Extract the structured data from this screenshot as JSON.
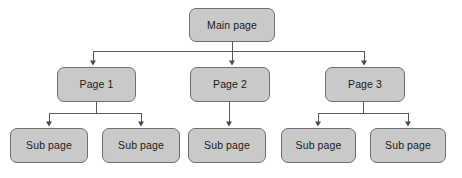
{
  "diagram": {
    "type": "tree",
    "orientation": "top-down",
    "colors": {
      "node_fill": "#c9c9c9",
      "node_border": "#6f6f6f",
      "connector": "#5a5a5a",
      "text": "#1a1a1a",
      "background": "#ffffff"
    },
    "nodes": [
      {
        "id": "main",
        "label": "Main page",
        "level": 0,
        "x": 189,
        "y": 8,
        "w": 86,
        "h": 34
      },
      {
        "id": "page1",
        "label": "Page 1",
        "level": 1,
        "x": 57,
        "y": 67,
        "w": 79,
        "h": 35
      },
      {
        "id": "page2",
        "label": "Page 2",
        "level": 1,
        "x": 190,
        "y": 67,
        "w": 80,
        "h": 35
      },
      {
        "id": "page3",
        "label": "Page 3",
        "level": 1,
        "x": 325,
        "y": 67,
        "w": 80,
        "h": 35
      },
      {
        "id": "sub1",
        "label": "Sub page",
        "level": 2,
        "x": 10,
        "y": 128,
        "w": 78,
        "h": 35
      },
      {
        "id": "sub2",
        "label": "Sub page",
        "level": 2,
        "x": 102,
        "y": 128,
        "w": 78,
        "h": 35
      },
      {
        "id": "sub3",
        "label": "Sub page",
        "level": 2,
        "x": 188,
        "y": 128,
        "w": 78,
        "h": 35
      },
      {
        "id": "sub4",
        "label": "Sub page",
        "level": 2,
        "x": 281,
        "y": 128,
        "w": 75,
        "h": 35
      },
      {
        "id": "sub5",
        "label": "Sub page",
        "level": 2,
        "x": 370,
        "y": 128,
        "w": 76,
        "h": 35
      }
    ],
    "edges": [
      {
        "from": "main",
        "to": "page1",
        "style": "elbow-arrow"
      },
      {
        "from": "main",
        "to": "page2",
        "style": "straight-arrow"
      },
      {
        "from": "main",
        "to": "page3",
        "style": "elbow-arrow"
      },
      {
        "from": "page1",
        "to": "sub1",
        "style": "elbow-arrow"
      },
      {
        "from": "page1",
        "to": "sub2",
        "style": "elbow-arrow"
      },
      {
        "from": "page2",
        "to": "sub3",
        "style": "straight-arrow"
      },
      {
        "from": "page3",
        "to": "sub4",
        "style": "elbow-arrow"
      },
      {
        "from": "page3",
        "to": "sub5",
        "style": "elbow-arrow"
      }
    ]
  }
}
